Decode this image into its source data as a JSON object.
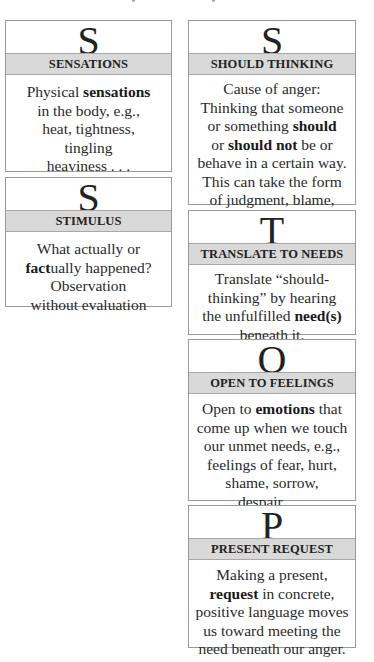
{
  "cards": {
    "sensations": {
      "letter": "S",
      "title": "SENSATIONS",
      "lines": [
        [
          {
            "t": "Physical "
          },
          {
            "t": "sensations",
            "b": true
          }
        ],
        [
          {
            "t": "in the body, e.g.,"
          }
        ],
        [
          {
            "t": "heat, tightness,"
          }
        ],
        [
          {
            "t": "tingling"
          }
        ],
        [
          {
            "t": "heaviness . . ."
          }
        ]
      ]
    },
    "stimulus": {
      "letter": "S",
      "title": "STIMULUS",
      "lines": [
        [
          {
            "t": "What actually or"
          }
        ],
        [
          {
            "t": "fact",
            "b": true
          },
          {
            "t": "ually happened?"
          }
        ],
        [
          {
            "t": "Observation"
          }
        ],
        [
          {
            "t": "without evaluation"
          }
        ]
      ]
    },
    "should_thinking": {
      "letter": "S",
      "title": "SHOULD THINKING",
      "lines": [
        [
          {
            "t": "Cause of anger:"
          }
        ],
        [
          {
            "t": "Thinking that someone"
          }
        ],
        [
          {
            "t": "or something "
          },
          {
            "t": "should",
            "b": true
          }
        ],
        [
          {
            "t": "or "
          },
          {
            "t": "should not",
            "b": true
          },
          {
            "t": " be or"
          }
        ],
        [
          {
            "t": "behave in a certain way."
          }
        ],
        [
          {
            "t": "This can take the form"
          }
        ],
        [
          {
            "t": "of judgment, blame,"
          }
        ],
        [
          {
            "t": "criticism . . ."
          }
        ]
      ]
    },
    "translate": {
      "letter": "T",
      "title": "TRANSLATE TO NEEDS",
      "lines": [
        [
          {
            "t": "Translate “should-"
          }
        ],
        [
          {
            "t": "thinking” by hearing"
          }
        ],
        [
          {
            "t": "the unfulfilled "
          },
          {
            "t": "need(s)",
            "b": true
          }
        ],
        [
          {
            "t": "beneath it."
          }
        ]
      ]
    },
    "open": {
      "letter": "O",
      "title": "OPEN TO FEELINGS",
      "lines": [
        [
          {
            "t": "Open to "
          },
          {
            "t": "emotions",
            "b": true
          },
          {
            "t": " that"
          }
        ],
        [
          {
            "t": "come up when we touch"
          }
        ],
        [
          {
            "t": "our unmet needs, e.g.,"
          }
        ],
        [
          {
            "t": "feelings of fear, hurt,"
          }
        ],
        [
          {
            "t": "shame, sorrow,"
          }
        ],
        [
          {
            "t": "despair . . ."
          }
        ]
      ]
    },
    "present": {
      "letter": "P",
      "title": "PRESENT REQUEST",
      "lines": [
        [
          {
            "t": "Making a present,"
          }
        ],
        [
          {
            "t": "request",
            "b": true
          },
          {
            "t": " in  concrete,"
          }
        ],
        [
          {
            "t": "positive language moves"
          }
        ],
        [
          {
            "t": "us toward meeting the"
          }
        ],
        [
          {
            "t": "need beneath our anger."
          }
        ]
      ]
    }
  },
  "colors": {
    "band": "#d9d9d9",
    "border": "#9a9a9a",
    "text": "#2a2a2a"
  }
}
